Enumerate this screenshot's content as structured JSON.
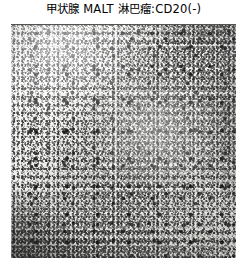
{
  "figure": {
    "caption": "甲状腺 MALT 淋巴瘤:CD20(-)",
    "caption_parts": {
      "organ": "甲状腺",
      "diagnosis": "MALT 淋巴瘤",
      "separator": ":",
      "marker": "CD20",
      "result": "(-)"
    },
    "image": {
      "name": "photomicrograph",
      "kind": "immunohistochemistry-photomicrograph",
      "alt_text": "甲状腺 MALT 淋巴瘤 CD20 免疫组化阴性染色显微照片",
      "color_mode": "grayscale",
      "colors": {
        "ink": "#000000",
        "page_background": "#ffffff",
        "slide_light": "#f7f7f5",
        "slide_mid": "#b4b4b0",
        "slide_dark": "#3a3a38",
        "frame_line": "#55524f"
      },
      "density_map": {
        "top_left": "light",
        "top_right": "moderate",
        "center": "moderate",
        "bottom_left": "dark",
        "bottom_right": "moderate-dark"
      }
    }
  }
}
